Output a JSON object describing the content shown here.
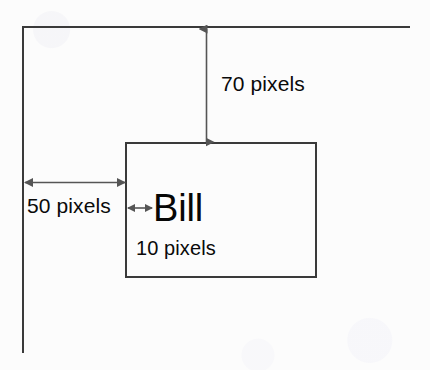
{
  "diagram": {
    "background_color": "#fcfcfc",
    "line_color": "#3a3a3a",
    "arrow_color": "#555555",
    "text_color": "#0a0a0a",
    "container": {
      "name": "parent-container-frame",
      "top_edge_label": "",
      "left_edge_label": ""
    },
    "element_box": {
      "name": "element-box",
      "content_text": "Bill"
    },
    "measurements": {
      "top_margin": {
        "label": "70 pixels",
        "value": 70,
        "unit": "pixels",
        "orientation": "vertical",
        "describes": "distance from container top edge to element box top edge"
      },
      "left_margin": {
        "label": "50 pixels",
        "value": 50,
        "unit": "pixels",
        "orientation": "horizontal",
        "describes": "distance from container left edge to element box left edge"
      },
      "left_padding": {
        "label": "10 pixels",
        "value": 10,
        "unit": "pixels",
        "orientation": "horizontal",
        "describes": "distance from element box left edge to the text content"
      }
    }
  }
}
